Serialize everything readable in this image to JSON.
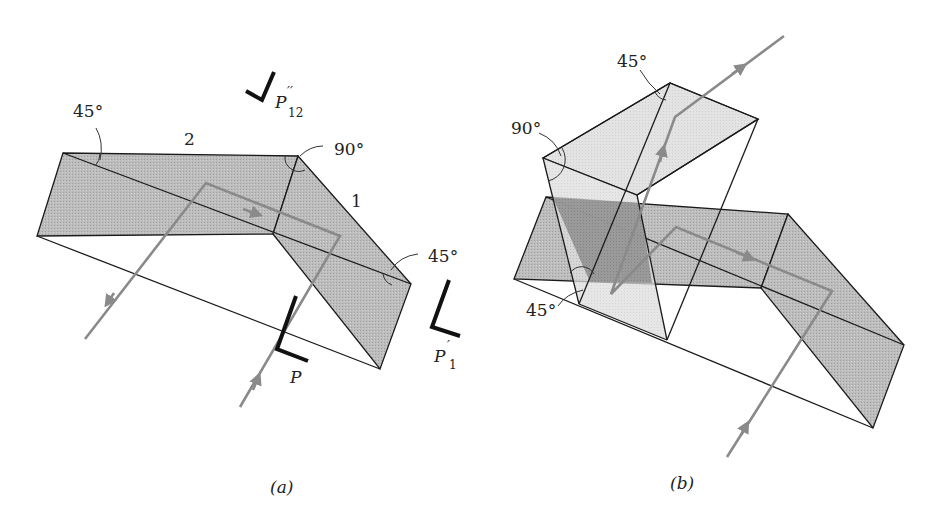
{
  "figure_a": {
    "caption": "(a)",
    "angle_labels": {
      "top_left": "45°",
      "top_right": "90°",
      "right": "45°"
    },
    "face_labels": {
      "face_2": "2",
      "face_1": "1"
    },
    "polarization_markers": {
      "input": {
        "base": "P",
        "sub": "",
        "prime": ""
      },
      "after_face1": {
        "base": "P",
        "sub": "1",
        "prime": "′"
      },
      "after_face12": {
        "base": "P",
        "sub": "12",
        "prime": "′′"
      }
    }
  },
  "figure_b": {
    "caption": "(b)",
    "angle_labels": {
      "upper_top": "45°",
      "upper_left": "90°",
      "lower_left": "45°"
    }
  },
  "colors": {
    "prism_fill": "#b9b9b9",
    "upper_prism_fill": "#dcdcdc",
    "overlap_fill": "#8f8f8f",
    "ray": "#8a8a8a",
    "edge": "#1a1a1a"
  }
}
